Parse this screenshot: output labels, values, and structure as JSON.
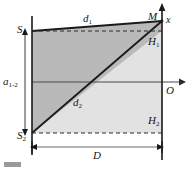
{
  "figure": {
    "labels": {
      "s1": "S",
      "s1_sub": "1",
      "s2": "S",
      "s2_sub": "2",
      "m": "M",
      "x_axis": "x",
      "o_origin": "O",
      "h1": "H",
      "h1_sub": "1",
      "h2": "H",
      "h2_sub": "2",
      "d1": "d",
      "d1_sub": "1",
      "d2": "d",
      "d2_sub": "2",
      "a12": "a",
      "a12_sub": "1-2",
      "big_d": "D"
    },
    "colors": {
      "dark_fill": "#b9b9b9",
      "light_fill": "#e2e2e2",
      "line": "#1a1a1a",
      "axis": "#4a4a4a",
      "dashed": "#2b2b2b",
      "background": "#ffffff"
    },
    "geometry": {
      "left_vertical_x": 32,
      "right_vertical_x": 162,
      "s1_top_y": 16,
      "s1_point_y": 31,
      "s2_point_y": 133,
      "m_point_y": 21,
      "h1_y": 31,
      "h2_y": 133,
      "axis_y": 82,
      "d_arrow_y": 147
    }
  }
}
